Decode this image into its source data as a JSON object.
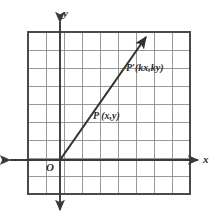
{
  "figure": {
    "background_color": "#ffffff"
  },
  "colors": {
    "grid_minor": "#8d8d8d",
    "grid_border": "#4a4a4a",
    "axis": "#3a3a3a",
    "ray": "#333333",
    "label": "#2b2b2b"
  },
  "grid": {
    "columns": 9,
    "rows": 9,
    "cell_size_px": 18,
    "left_px": 28,
    "top_px": 32,
    "right_px": 190,
    "bottom_px": 194
  },
  "axes": {
    "x": {
      "label": "x",
      "y_px": 160,
      "start_px": 8,
      "end_px": 200,
      "arrow_start": true,
      "arrow_end": true
    },
    "y": {
      "label": "y",
      "x_px": 60,
      "start_px": 20,
      "end_px": 212,
      "arrow_start": true,
      "arrow_end": true
    }
  },
  "origin": {
    "label": "O",
    "x_px": 60,
    "y_px": 160
  },
  "ray": {
    "from": {
      "x_px": 60,
      "y_px": 160
    },
    "to": {
      "x_px": 149,
      "y_px": 33
    },
    "arrow_end": true
  },
  "points": [
    {
      "name": "P",
      "label": "P (x,y)",
      "x_px": 96,
      "y_px": 109
    },
    {
      "name": "P-prime",
      "label": "P′(kx,ky)",
      "x_px": 128,
      "y_px": 63
    }
  ]
}
